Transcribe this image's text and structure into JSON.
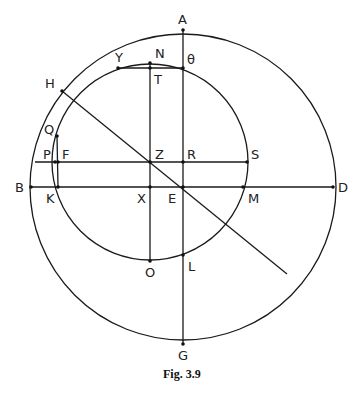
{
  "figure": {
    "caption": "Fig. 3.9",
    "colors": {
      "ink": "#1a1a1a",
      "background": "#ffffff"
    },
    "points": [
      {
        "id": "A",
        "label": "A"
      },
      {
        "id": "N",
        "label": "N"
      },
      {
        "id": "theta",
        "label": "θ"
      },
      {
        "id": "Y",
        "label": "Y"
      },
      {
        "id": "T",
        "label": "T"
      },
      {
        "id": "H",
        "label": "H"
      },
      {
        "id": "Q",
        "label": "Q"
      },
      {
        "id": "P",
        "label": "P"
      },
      {
        "id": "F",
        "label": "F"
      },
      {
        "id": "Z",
        "label": "Z"
      },
      {
        "id": "R",
        "label": "R"
      },
      {
        "id": "S",
        "label": "S"
      },
      {
        "id": "B",
        "label": "B"
      },
      {
        "id": "K",
        "label": "K"
      },
      {
        "id": "X",
        "label": "X"
      },
      {
        "id": "E",
        "label": "E"
      },
      {
        "id": "M",
        "label": "M"
      },
      {
        "id": "D",
        "label": "D"
      },
      {
        "id": "O",
        "label": "O"
      },
      {
        "id": "L",
        "label": "L"
      },
      {
        "id": "G",
        "label": "G"
      }
    ],
    "circles": [
      {
        "name": "outer-circle",
        "center": "E",
        "through": [
          "A",
          "B",
          "D",
          "G",
          "H"
        ]
      },
      {
        "name": "inner-circle",
        "center": "Z",
        "through": [
          "N",
          "O",
          "K",
          "S",
          "Y",
          "Q",
          "theta",
          "L",
          "M"
        ]
      }
    ],
    "segments": [
      [
        "A",
        "G"
      ],
      [
        "B",
        "D"
      ],
      [
        "N",
        "O"
      ],
      [
        "P",
        "S"
      ],
      [
        "Y",
        "theta"
      ],
      [
        "H",
        "E"
      ]
    ]
  }
}
